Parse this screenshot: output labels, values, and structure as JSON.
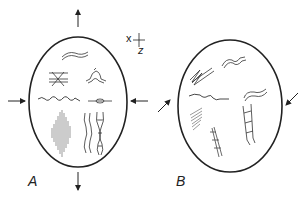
{
  "figure": {
    "panels": [
      {
        "id": "A",
        "label": "A",
        "description": "Ellipse with vertical extension arrows and horizontal compression arrows; strain features inside"
      },
      {
        "id": "B",
        "label": "B",
        "description": "Ellipse with oblique compression arrows; rotated strain features inside"
      }
    ],
    "axes": {
      "x_label": "x",
      "z_label": "z"
    },
    "colors": {
      "ink": "#222222",
      "background": "#ffffff"
    }
  }
}
